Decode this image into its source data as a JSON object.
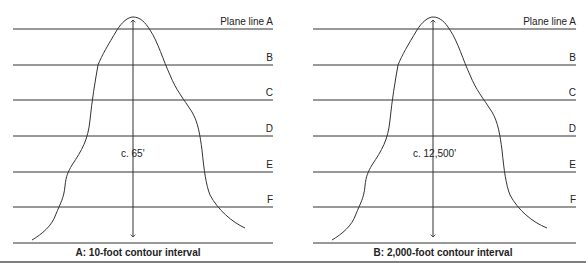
{
  "panels": [
    {
      "id": "A",
      "caption": "A: 10-foot contour interval",
      "height_label": "c. 65'",
      "plane_labels": [
        "Plane line A",
        "B",
        "C",
        "D",
        "E",
        "F"
      ]
    },
    {
      "id": "B",
      "caption": "B: 2,000-foot contour interval",
      "height_label": "c. 12,500'",
      "plane_labels": [
        "Plane line A",
        "B",
        "C",
        "D",
        "E",
        "F"
      ]
    }
  ],
  "colors": {
    "line": "#333333",
    "background": "#ffffff"
  }
}
